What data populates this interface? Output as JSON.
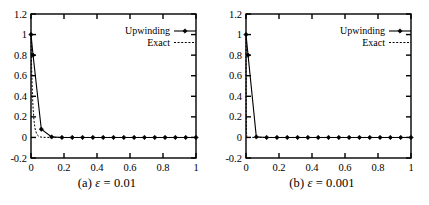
{
  "figure": {
    "panel_count": 2
  },
  "panels": [
    {
      "id": "a",
      "caption_prefix": "(a)",
      "caption_symbol": "ε",
      "caption_equals": "=",
      "caption_value": "0.01",
      "caption_full": "(a) ε = 0.01",
      "chart_data": {
        "type": "line",
        "title": "(a) ε = 0.01",
        "xlabel": "",
        "ylabel": "",
        "xlim": [
          0,
          1
        ],
        "ylim": [
          -0.2,
          1.2
        ],
        "xticks": [
          0,
          0.2,
          0.4,
          0.6,
          0.8,
          1
        ],
        "xticklabels": [
          "0",
          "0.2",
          "0.4",
          "0.6",
          "0.8",
          "1"
        ],
        "yticks": [
          -0.2,
          0,
          0.2,
          0.4,
          0.6,
          0.8,
          1,
          1.2
        ],
        "yticklabels": [
          "-0.2",
          "0",
          "0.2",
          "0.4",
          "0.6",
          "0.8",
          "1",
          "1.2"
        ],
        "grid": false,
        "legend_position": "upper right",
        "series": [
          {
            "name": "Upwinding",
            "style": "solid-with-markers",
            "marker": "filled-diamond",
            "x": [
              0,
              0.0125,
              0.0625,
              0.125,
              0.1875,
              0.25,
              0.3125,
              0.375,
              0.4375,
              0.5,
              0.5625,
              0.625,
              0.6875,
              0.75,
              0.8125,
              0.875,
              0.9375,
              1
            ],
            "y": [
              1,
              0.8,
              0.08,
              0.005,
              0,
              0,
              0,
              0,
              0,
              0,
              0,
              0,
              0,
              0,
              0,
              0,
              0,
              0
            ]
          },
          {
            "name": "Exact",
            "style": "dashed",
            "marker": "none",
            "x": [
              0,
              0.004,
              0.008,
              0.012,
              0.018,
              0.025,
              0.035,
              0.05,
              0.07,
              0.1,
              0.2,
              0.4,
              0.6,
              0.8,
              1
            ],
            "y": [
              1,
              0.67,
              0.45,
              0.3,
              0.165,
              0.082,
              0.03,
              0.0067,
              0.0009,
              0.0001,
              0,
              0,
              0,
              0,
              0
            ]
          }
        ]
      }
    },
    {
      "id": "b",
      "caption_prefix": "(b)",
      "caption_symbol": "ε",
      "caption_equals": "=",
      "caption_value": "0.001",
      "caption_full": "(b) ε = 0.001",
      "chart_data": {
        "type": "line",
        "title": "(b) ε = 0.001",
        "xlabel": "",
        "ylabel": "",
        "xlim": [
          0,
          1
        ],
        "ylim": [
          -0.2,
          1.2
        ],
        "xticks": [
          0,
          0.2,
          0.4,
          0.6,
          0.8,
          1
        ],
        "xticklabels": [
          "0",
          "0.2",
          "0.4",
          "0.6",
          "0.8",
          "1"
        ],
        "yticks": [
          -0.2,
          0,
          0.2,
          0.4,
          0.6,
          0.8,
          1,
          1.2
        ],
        "yticklabels": [
          "-0.2",
          "0",
          "0.2",
          "0.4",
          "0.6",
          "0.8",
          "1",
          "1.2"
        ],
        "grid": false,
        "legend_position": "upper right",
        "series": [
          {
            "name": "Upwinding",
            "style": "solid-with-markers",
            "marker": "filled-diamond",
            "x": [
              0,
              0.0125,
              0.0625,
              0.125,
              0.1875,
              0.25,
              0.3125,
              0.375,
              0.4375,
              0.5,
              0.5625,
              0.625,
              0.6875,
              0.75,
              0.8125,
              0.875,
              0.9375,
              1
            ],
            "y": [
              1,
              0.8,
              0.005,
              0,
              0,
              0,
              0,
              0,
              0,
              0,
              0,
              0,
              0,
              0,
              0,
              0,
              0,
              0
            ]
          },
          {
            "name": "Exact",
            "style": "dashed",
            "marker": "none",
            "x": [
              0,
              0.0005,
              0.001,
              0.002,
              0.003,
              0.005,
              0.008,
              0.012,
              0.02,
              0.05,
              0.1,
              0.2,
              0.4,
              0.6,
              0.8,
              1
            ],
            "y": [
              1,
              0.61,
              0.37,
              0.135,
              0.05,
              0.0067,
              0.0003,
              0,
              0,
              0,
              0,
              0,
              0,
              0,
              0,
              0
            ]
          }
        ]
      }
    }
  ],
  "legend": {
    "entries": [
      {
        "label": "Upwinding",
        "style": "solid-with-markers"
      },
      {
        "label": "Exact",
        "style": "dashed"
      }
    ]
  },
  "colors": {
    "line": "#000000",
    "axis": "#000000",
    "background": "#ffffff"
  }
}
